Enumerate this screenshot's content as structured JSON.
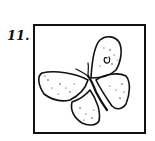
{
  "figure": {
    "number_label": "11.",
    "colors": {
      "ink": "#111111",
      "background": "#ffffff"
    }
  }
}
